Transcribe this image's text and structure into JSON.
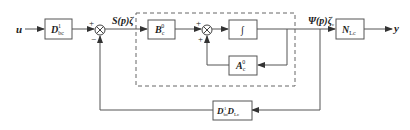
{
  "diagram": {
    "input_label": "u",
    "output_label": "y",
    "blocks": {
      "input_gain": {
        "main": "D",
        "sub": "bc",
        "sup": "-1"
      },
      "b_matrix": {
        "main": "B",
        "sub": "c",
        "sup": "0"
      },
      "integrator": {
        "symbol": "∫"
      },
      "a_matrix": {
        "main": "A",
        "sub": "c",
        "sup": "0"
      },
      "output_gain": {
        "main": "N",
        "sub": "Lc"
      },
      "feedback_gain": {
        "main1": "D",
        "sub1": "bc",
        "sup1": "-1",
        "main2": "D",
        "sub2": "Lc"
      }
    },
    "signals": {
      "s_label": "S(p)ζ",
      "psi_label": "Ψ(p)ζ",
      "psi_sub": "c"
    },
    "summing_junctions": {
      "sum1": {
        "top_sign": "+",
        "bottom_sign": "−"
      },
      "sum2": {
        "top_sign": "+",
        "bottom_sign": "+"
      }
    }
  }
}
